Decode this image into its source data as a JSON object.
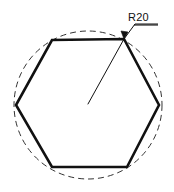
{
  "drawing": {
    "title": "Hexagon inscribed in construction circle",
    "canvas": {
      "width": 174,
      "height": 192,
      "background": "#ffffff"
    },
    "line_color": "#111111",
    "construction_color": "#333333",
    "dimension": {
      "label": "R20",
      "kind": "radius",
      "value": 20,
      "prefix": "R",
      "underlined": true,
      "text_x": 128,
      "text_y": 21,
      "leader_points": "124,39 135,24 158,24",
      "underline_points": "134,25 158,25",
      "arrow_points": "124,39 121,31 128,32"
    },
    "circle": {
      "name": "construction-circle",
      "cx": 88,
      "cy": 105,
      "r": 74,
      "stroke_width": 1,
      "dash": "6 4"
    },
    "hexagon": {
      "name": "hexagon-outline",
      "stroke_width": 2.6,
      "points": "52,40 124,39 159,105 127,167 52,167 16,105",
      "vertices": [
        {
          "name": "vertex-top-left",
          "x": 52,
          "y": 40
        },
        {
          "name": "vertex-top-right",
          "x": 124,
          "y": 39
        },
        {
          "name": "vertex-right",
          "x": 159,
          "y": 105
        },
        {
          "name": "vertex-bottom-right",
          "x": 127,
          "y": 167
        },
        {
          "name": "vertex-bottom-left",
          "x": 52,
          "y": 167
        },
        {
          "name": "vertex-left",
          "x": 16,
          "y": 105
        }
      ]
    },
    "radius_line": {
      "name": "radius-line",
      "x1": 88,
      "y1": 104,
      "x2": 124,
      "y2": 39,
      "stroke_width": 1
    }
  }
}
